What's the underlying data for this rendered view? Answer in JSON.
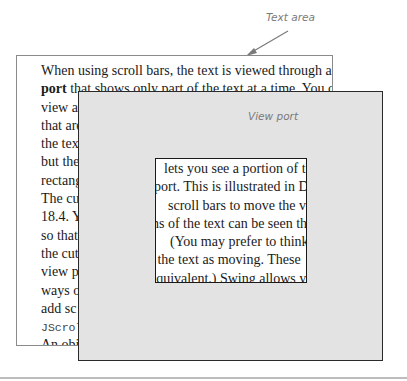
{
  "labels": {
    "text_area": "Text area",
    "view_port": "View port"
  },
  "text_area": {
    "lines": [
      {
        "pre": "When using scroll bars, the text is viewed through a ",
        "bold": "view",
        "post": ""
      },
      {
        "pre": "",
        "bold": "port",
        "post": " that shows only part of the text at a time. You can"
      },
      {
        "pre": "view a",
        "bold": "",
        "post": ""
      },
      {
        "pre": "that are",
        "bold": "",
        "post": ""
      },
      {
        "pre": "the text",
        "bold": "",
        "post": ""
      },
      {
        "pre": "but the",
        "bold": "",
        "post": ""
      },
      {
        "pre": "rectang",
        "bold": "",
        "post": ""
      },
      {
        "pre": "The cu",
        "bold": "",
        "post": ""
      },
      {
        "pre": "18.4. Y",
        "bold": "",
        "post": ""
      },
      {
        "pre": "so that",
        "bold": "",
        "post": ""
      },
      {
        "pre": "the cut",
        "bold": "",
        "post": ""
      },
      {
        "pre": "view po",
        "bold": "",
        "post": ""
      },
      {
        "pre": "ways o",
        "bold": "",
        "post": ""
      },
      {
        "pre": "add sc",
        "bold": "",
        "post": ""
      },
      {
        "pre": "",
        "bold": "",
        "post": "",
        "mono": "JScroll"
      },
      {
        "pre": "An obj",
        "bold": "",
        "post": ""
      },
      {
        "pre": "port wi",
        "bold": "",
        "post": ""
      }
    ]
  },
  "view_port": {
    "lines": [
      "lets you see a portion of the",
      "port. This is illustrated in Dis",
      "scroll bars to move the view",
      "ns of the text can be seen thro",
      "(You may prefer to think of",
      "l the text as moving. These",
      "equivalent.) Swing allows you"
    ]
  },
  "colors": {
    "viewport_fill": "#e3e3e3",
    "label_gray": "#7a7a7a",
    "border_dark": "#2a2a2a"
  }
}
